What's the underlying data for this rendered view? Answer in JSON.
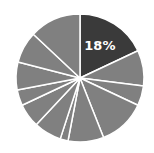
{
  "chart_data": {
    "type": "pie",
    "title": "",
    "start_angle_deg": 0,
    "direction": "clockwise",
    "values": [
      18,
      9,
      5,
      12,
      9,
      2,
      7,
      6,
      4,
      7,
      8,
      13
    ],
    "highlight_index": 0,
    "labels_shown": [
      "18%"
    ],
    "colors": {
      "highlight": "#3a3a3a",
      "other": "#808080",
      "separator": "#ffffff"
    }
  },
  "highlight_label": "18%"
}
